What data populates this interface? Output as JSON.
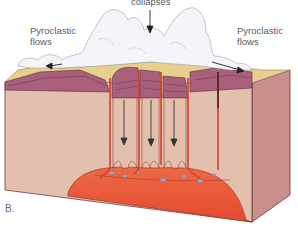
{
  "diagram": {
    "panel_label": "B.",
    "labels": {
      "collapses": "collapses",
      "pyroclastic_left_line1": "Pyroclastic",
      "pyroclastic_left_line2": "flows",
      "pyroclastic_right_line1": "Pyroclastic",
      "pyroclastic_right_line2": "flows"
    },
    "elements": [
      "eruption-cloud",
      "pyroclastic-flow-left",
      "pyroclastic-flow-right",
      "collapse-arrow-top",
      "layered-surface-rock",
      "collapsing-blocks",
      "ring-faults",
      "down-arrows",
      "magma-chamber",
      "crustal-block-front",
      "crustal-block-side"
    ],
    "colors": {
      "crust_front": "#e3bfae",
      "crust_side": "#c98f8c",
      "surface_layers": "#a9607c",
      "magma": "#e8553a",
      "magma_glow": "#f39a6a",
      "faults": "#d2402a",
      "cloud": "#f4f5f8",
      "tan_surface": "#e7cf8e"
    }
  }
}
